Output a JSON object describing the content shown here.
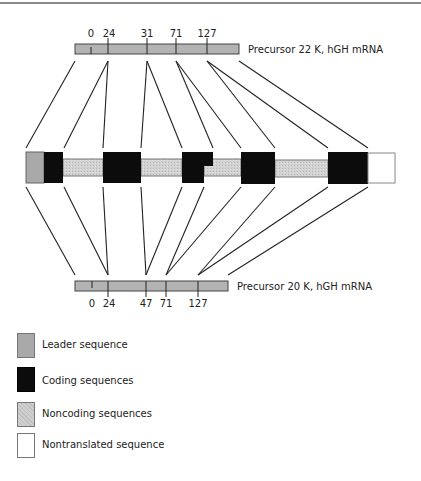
{
  "precursor_22k": {
    "label": "Precursor 22 K, hGH mRNA",
    "ticks": [
      "0",
      "24",
      "31",
      "71",
      "127"
    ]
  },
  "precursor_20k": {
    "label": "Precursor 20 K, hGH mRNA",
    "ticks": [
      "0",
      "24",
      "47",
      "71",
      "127"
    ]
  },
  "gene_segments": [
    {
      "type": "leader"
    },
    {
      "type": "coding",
      "index": 1
    },
    {
      "type": "noncoding",
      "index": 1
    },
    {
      "type": "coding",
      "index": 2
    },
    {
      "type": "noncoding",
      "index": 2
    },
    {
      "type": "coding",
      "index": 3
    },
    {
      "type": "noncoding",
      "index": 3
    },
    {
      "type": "coding",
      "index": 4
    },
    {
      "type": "noncoding",
      "index": 4
    },
    {
      "type": "coding",
      "index": 5
    },
    {
      "type": "nontranslated"
    }
  ],
  "legend": {
    "items": [
      {
        "key": "leader",
        "label": "Leader sequence",
        "color": "#a9a9a9"
      },
      {
        "key": "coding",
        "label": "Coding sequences",
        "color": "#0c0c0c"
      },
      {
        "key": "noncoding",
        "label": "Noncoding sequences",
        "color": "#cfcfcf"
      },
      {
        "key": "nontranslated",
        "label": "Nontranslated sequence",
        "color": "#ffffff"
      }
    ]
  }
}
